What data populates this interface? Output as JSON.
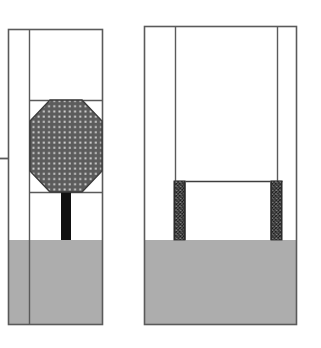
{
  "drawing": {
    "title": "Two-panel structural section drawing",
    "background_color": "#ffffff",
    "stroke_color": "#5a5a5a",
    "dark_stroke_color": "#3d3d3d",
    "base_fill_color": "#adadad",
    "octagon_fill_color": "#5c5c5c",
    "octagon_dot_color": "#d8d8d8",
    "stem_fill_color": "#111111",
    "column_hatch_color": "#2b2b2b",
    "column_base_color": "#9a9a9a",
    "panels": [
      {
        "name": "left-panel",
        "label": "Left elevation with octagonal element",
        "outer_rect": {
          "x": 8,
          "y": 29,
          "width": 95,
          "height": 296
        },
        "inner_wall_x": 29,
        "divider_y_top": 100,
        "divider_y_bottom": 192,
        "base_y": 240,
        "base_height": 85,
        "tick_mark": {
          "x1": 0,
          "x2": 8,
          "y": 158
        },
        "octagon": {
          "name": "octagon-element",
          "center_x": 66,
          "center_y": 146,
          "width": 73,
          "height": 93,
          "corner_cut": 21
        },
        "stem": {
          "x": 61,
          "y": 192,
          "width": 10,
          "height": 48
        }
      },
      {
        "name": "right-panel",
        "label": "Right elevation with twin hatched columns",
        "outer_rect": {
          "x": 144,
          "y": 26,
          "width": 153,
          "height": 299
        },
        "inner_wall_left_x": 175,
        "inner_wall_right_x": 278,
        "divider_y": 181,
        "base_y": 240,
        "base_height": 85,
        "columns": [
          {
            "name": "hatched-column-left",
            "x": 174,
            "y": 181,
            "width": 11,
            "height": 59
          },
          {
            "name": "hatched-column-right",
            "x": 271,
            "y": 181,
            "width": 11,
            "height": 59
          }
        ]
      }
    ]
  }
}
